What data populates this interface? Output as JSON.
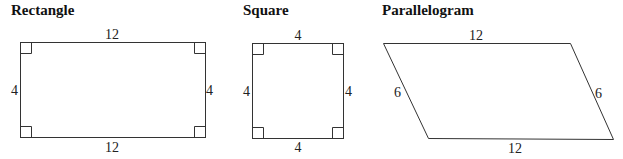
{
  "shapes": [
    {
      "name": "Rectangle",
      "labels": {
        "top": "12",
        "bottom": "12",
        "left": "4",
        "right": "4"
      },
      "right_angles": 4
    },
    {
      "name": "Square",
      "labels": {
        "top": "4",
        "bottom": "4",
        "left": "4",
        "right": "4"
      },
      "right_angles": 4
    },
    {
      "name": "Parallelogram",
      "labels": {
        "top": "12",
        "bottom": "12",
        "left": "6",
        "right": "6"
      },
      "right_angles": 0
    }
  ]
}
